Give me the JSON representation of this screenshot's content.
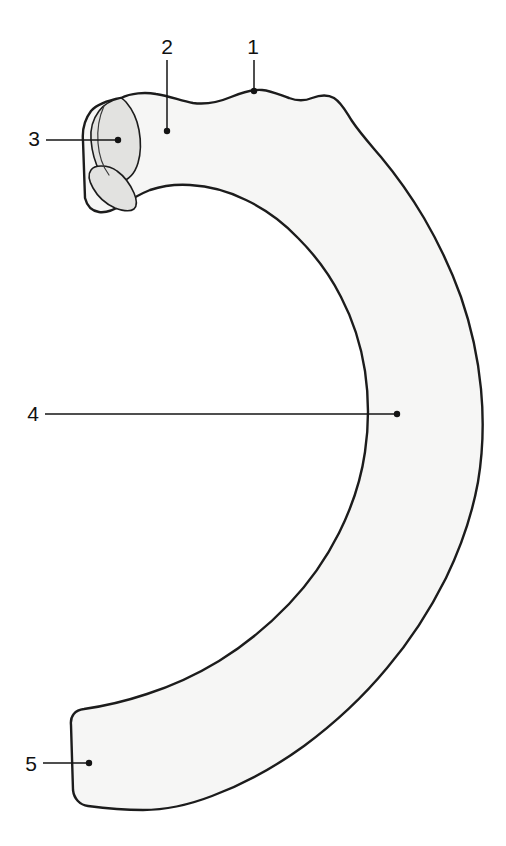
{
  "figure": {
    "background_color": "#ffffff",
    "bone_fill_color": "#f6f6f5",
    "facet_fill_color": "#e2e2e0",
    "outline_color": "#1c1c1c",
    "leader_color": "#141414",
    "width": 506,
    "height": 846
  },
  "callouts": [
    {
      "id": "callout-1",
      "number": "1",
      "label_x": 253,
      "label_y": 48,
      "dot_x": 254,
      "dot_y": 91,
      "orientation": "vertical"
    },
    {
      "id": "callout-2",
      "number": "2",
      "label_x": 167,
      "label_y": 48,
      "dot_x": 167,
      "dot_y": 131,
      "orientation": "vertical"
    },
    {
      "id": "callout-3",
      "number": "3",
      "label_x": 34,
      "label_y": 140,
      "dot_x": 118,
      "dot_y": 140,
      "orientation": "horizontal"
    },
    {
      "id": "callout-4",
      "number": "4",
      "label_x": 33,
      "label_y": 415,
      "dot_x": 397,
      "dot_y": 414,
      "orientation": "horizontal"
    },
    {
      "id": "callout-5",
      "number": "5",
      "label_x": 31,
      "label_y": 765,
      "dot_x": 89,
      "dot_y": 763,
      "orientation": "horizontal"
    }
  ],
  "shapes": {
    "bone_outline_path": "M 121 98 C 131 93 145 92 156 94 C 170 96 181 101 193 103 C 207 105 219 102 231 97 C 243 92 252 89 262 90 C 272 91 280 95 289 98 C 297 101 305 101 312 98 C 320 95 327 94 334 98 C 342 103 346 112 352 121 C 360 133 370 144 381 157 C 396 175 411 196 424 218 C 438 242 451 269 461 297 C 471 326 478 357 481 389 C 484 421 483 452 478 482 C 472 515 461 547 446 578 C 430 610 410 641 387 668 C 363 697 335 723 304 746 C 275 767 244 784 212 796 C 186 806 163 810 143 810 C 120 810 103 808 88 806 C 80 805 74 799 73 790 L 71 725 C 70 716 75 710 84 709 C 105 706 126 701 147 694 C 172 686 196 675 219 661 C 245 645 268 626 289 604 C 309 583 326 559 339 533 C 352 507 361 480 365 452 C 369 425 369 398 365 371 C 361 345 353 320 341 297 C 330 275 315 255 298 238 C 283 222 265 209 246 200 C 228 191 209 186 190 185 C 175 184 162 186 150 190 C 140 194 130 200 122 205 C 114 210 106 213 99 212 C 92 211 87 206 85 198 L 83 141 C 82 130 85 119 91 111 C 98 103 110 100 121 98 Z",
    "facet_path": "M 121 98 C 112 100 104 104 99 111 C 93 119 90 129 91 140 C 92 152 95 163 100 172 C 105 180 112 184 120 182 C 129 180 135 173 138 163 C 141 153 141 141 139 130 C 137 119 132 109 126 102 C 124 100 122 98 121 98 Z",
    "facet_lower_path": "M 101 166 C 106 166 112 167 117 171 C 124 176 130 184 134 193 C 137 200 137 206 134 209 C 130 212 123 211 115 208 C 106 204 98 197 93 188 C 89 181 88 174 91 170 C 93 167 97 166 101 166 Z",
    "facet_ridge_path": "M 104 106 C 99 117 97 130 98 143 C 99 156 103 167 109 175"
  }
}
